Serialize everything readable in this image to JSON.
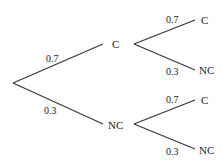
{
  "diagram": {
    "type": "probability-tree",
    "root": {
      "branches": [
        {
          "probability": "0.7",
          "outcome": "C",
          "branches": [
            {
              "probability": "0.7",
              "outcome": "C"
            },
            {
              "probability": "0.3",
              "outcome": "NC"
            }
          ]
        },
        {
          "probability": "0.3",
          "outcome": "NC",
          "branches": [
            {
              "probability": "0.7",
              "outcome": "C"
            },
            {
              "probability": "0.3",
              "outcome": "NC"
            }
          ]
        }
      ]
    }
  }
}
